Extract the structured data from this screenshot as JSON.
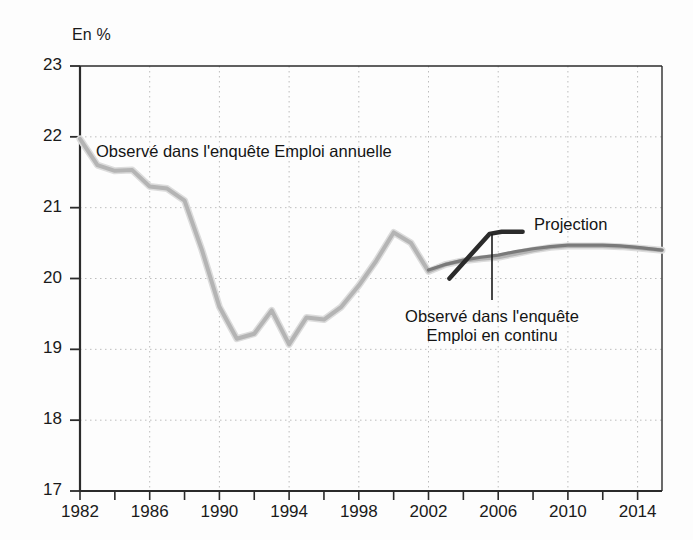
{
  "chart_data": {
    "type": "line",
    "title": "",
    "subtitle": "",
    "xlabel": "",
    "ylabel": "En %",
    "unit_label": "En %",
    "xlim": [
      1982,
      2015.4
    ],
    "ylim": [
      17,
      23
    ],
    "grid": true,
    "grid_style": "dotted",
    "legend_position": "inline-annotations",
    "y_ticks": [
      23,
      22,
      21,
      20,
      19,
      18,
      17
    ],
    "y_tick_labels": [
      "23",
      "22",
      "21",
      "20",
      "19",
      "18",
      "17"
    ],
    "x_ticks": [
      1982,
      1984,
      1986,
      1988,
      1990,
      1992,
      1994,
      1996,
      1998,
      2000,
      2002,
      2004,
      2006,
      2008,
      2010,
      2012,
      2014
    ],
    "x_tick_labels_shown": [
      "1982",
      "1986",
      "1990",
      "1994",
      "1998",
      "2002",
      "2006",
      "2010",
      "2014"
    ],
    "x_labelled_ticks": [
      1982,
      1986,
      1990,
      1994,
      1998,
      2002,
      2006,
      2010,
      2014
    ],
    "x_gridlines": [
      1986,
      1990,
      1994,
      1998,
      2002,
      2006,
      2010,
      2014
    ],
    "series": [
      {
        "name": "Observé dans l'enquête Emploi annuelle",
        "color": "#b4b4b4",
        "width": 4,
        "x": [
          1982,
          1983,
          1984,
          1985,
          1986,
          1987,
          1988,
          1989,
          1990,
          1991,
          1992,
          1993,
          1994,
          1995,
          1996,
          1997,
          1998,
          1999,
          2000,
          2001,
          2002,
          2003,
          2004,
          2005,
          2006,
          2007,
          2008,
          2009,
          2010,
          2011,
          2012,
          2013,
          2014,
          2015.4
        ],
        "values": [
          21.97,
          21.6,
          21.52,
          21.53,
          21.3,
          21.27,
          21.1,
          20.4,
          19.6,
          19.15,
          19.22,
          19.55,
          19.07,
          19.45,
          19.42,
          19.6,
          19.9,
          20.25,
          20.65,
          20.5,
          20.1,
          20.2,
          20.25,
          20.28,
          20.3,
          20.35,
          20.4,
          20.44,
          20.46,
          20.46,
          20.46,
          20.45,
          20.43,
          20.4
        ]
      },
      {
        "name": "Projection",
        "color": "#7a7a7a",
        "width": 3.2,
        "note": "Darker mid-grey projection path overlaying the annual-survey series from 2003 onward",
        "x": [
          2002,
          2003,
          2004,
          2005,
          2006,
          2007,
          2008,
          2009,
          2010,
          2011,
          2012,
          2013,
          2014,
          2015.4
        ],
        "values": [
          20.12,
          20.2,
          20.26,
          20.3,
          20.33,
          20.38,
          20.42,
          20.45,
          20.47,
          20.47,
          20.47,
          20.46,
          20.44,
          20.4
        ]
      },
      {
        "name": "Observé dans l'enquête Emploi en continu",
        "color": "#2b2b2b",
        "width": 4.5,
        "x": [
          2003.2,
          2005.5,
          2006.2,
          2007.4
        ],
        "values": [
          20.0,
          20.63,
          20.66,
          20.66
        ]
      }
    ],
    "annotations": [
      {
        "id": "annual-survey-label",
        "text": "Observé dans l'enquête Emploi annuelle",
        "x_px": 96,
        "y_px": 142
      },
      {
        "id": "projection-label",
        "text": "Projection",
        "x_px": 534,
        "y_px": 215
      },
      {
        "id": "continuous-survey-label-line1",
        "text": "Observé dans l'enquête",
        "x_px": 492,
        "y_px": 307
      },
      {
        "id": "continuous-survey-label-line2",
        "text": "Emploi en continu",
        "x_px": 492,
        "y_px": 326
      }
    ],
    "leader_line": {
      "from_x_px": 492,
      "from_y_px": 300,
      "to_x_px": 492,
      "to_y_px": 234
    }
  },
  "axis": {
    "unit_label": "En %",
    "y_labels": [
      "23",
      "22",
      "21",
      "20",
      "19",
      "18",
      "17"
    ],
    "x_labels": [
      "1982",
      "1986",
      "1990",
      "1994",
      "1998",
      "2002",
      "2006",
      "2010",
      "2014"
    ]
  },
  "labels": {
    "annual_survey": "Observé dans l'enquête Emploi annuelle",
    "projection": "Projection",
    "continuous_survey_line1": "Observé dans l'enquête",
    "continuous_survey_line2": "Emploi en continu"
  },
  "colors": {
    "annual_series": "#b4b4b4",
    "projection_series": "#7a7a7a",
    "continuous_series": "#2b2b2b",
    "axis": "#2b2b2b",
    "grid": "#bdbdbd",
    "text": "#1a1a1a",
    "background": "#fdfdfd"
  }
}
